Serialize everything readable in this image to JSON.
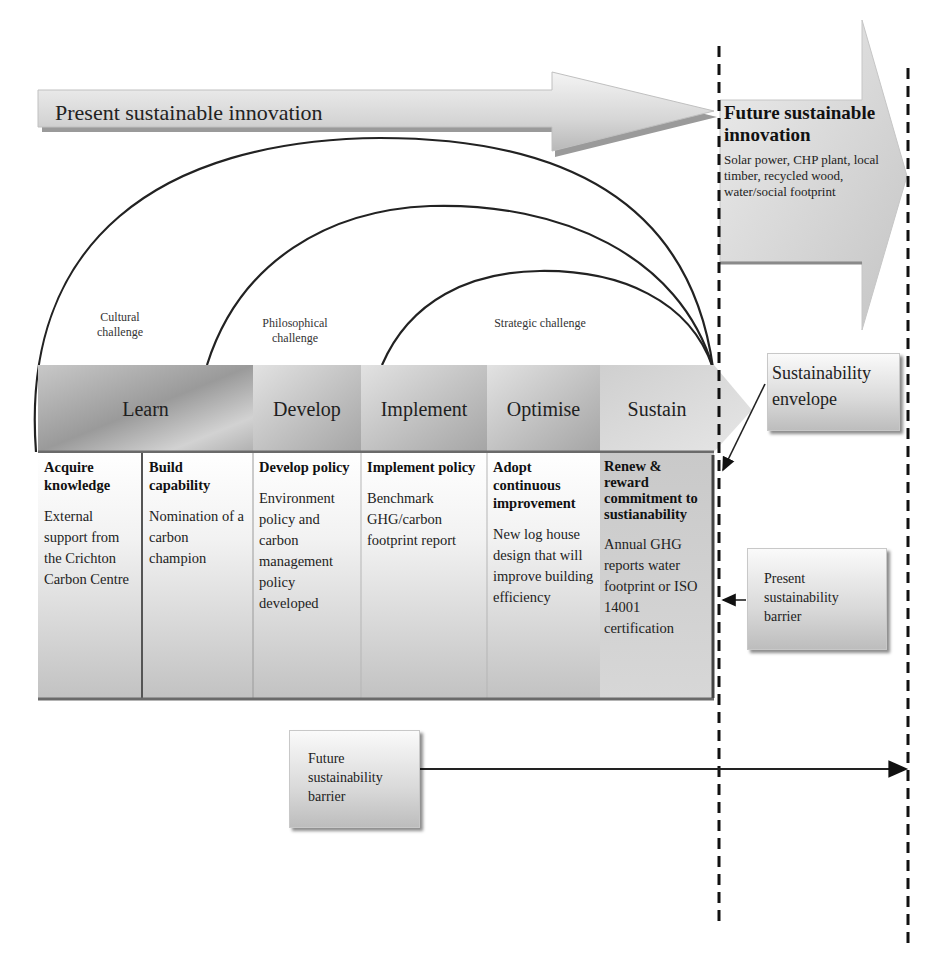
{
  "present_arrow": {
    "label": "Present sustainable innovation"
  },
  "future_arrow": {
    "title": "Future sustainable innovation",
    "description": "Solar power, CHP plant, local timber, recycled wood, water/social footprint"
  },
  "challenges": [
    {
      "id": "cultural",
      "line1": "Cultural",
      "line2": "challenge"
    },
    {
      "id": "philosophical",
      "line1": "Philosophical",
      "line2": "challenge"
    },
    {
      "id": "strategic",
      "line1": "Strategic challenge",
      "line2": ""
    }
  ],
  "stages": [
    {
      "label": "Learn"
    },
    {
      "label": "Develop"
    },
    {
      "label": "Implement"
    },
    {
      "label": "Optimise"
    },
    {
      "label": "Sustain"
    }
  ],
  "cells": [
    {
      "title": "Acquire knowledge",
      "description": "External support from the Crichton Carbon Centre"
    },
    {
      "title": "Build capability",
      "description": "Nomination of a carbon champion"
    },
    {
      "title": "Develop policy",
      "description": "Environment policy and carbon management policy developed"
    },
    {
      "title": "Implement policy",
      "description": "Benchmark GHG/carbon footprint report"
    },
    {
      "title": "Adopt continuous improvement",
      "description": "New log house design that will improve building efficiency"
    },
    {
      "title": "Renew & reward commitment to sustianability",
      "description": "Annual GHG reports water footprint or ISO 14001 certification"
    }
  ],
  "callouts": {
    "envelope": "Sustainability envelope",
    "present_barrier": "Present sustainability barrier",
    "future_barrier": "Future sustainability barrier"
  }
}
